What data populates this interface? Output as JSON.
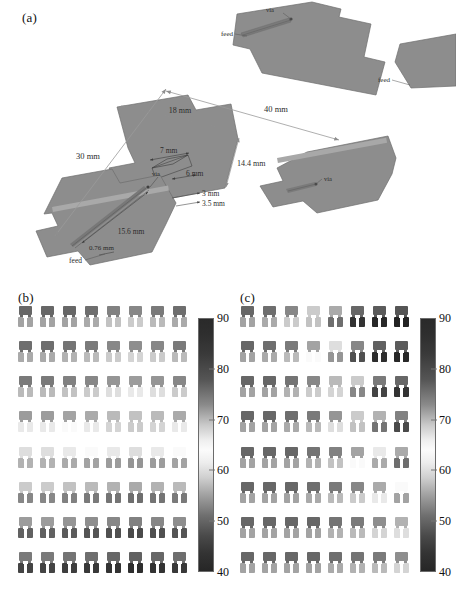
{
  "figure": {
    "panels": [
      {
        "id": "a",
        "label": "(a)"
      },
      {
        "id": "b",
        "label": "(b)"
      },
      {
        "id": "c",
        "label": "(c)"
      }
    ]
  },
  "panel_a": {
    "label": "(a)",
    "description": "Three-dimensional exploded schematic of a stacked patch antenna element with feed lines and vias",
    "annotations": [
      {
        "name": "overall-length",
        "text": "40 mm"
      },
      {
        "name": "overall-width",
        "text": "30 mm"
      },
      {
        "name": "patch-length",
        "text": "18 mm"
      },
      {
        "name": "patch-width",
        "text": "14.4 mm"
      },
      {
        "name": "slot-length",
        "text": "7 mm"
      },
      {
        "name": "slot-offset",
        "text": "6 mm"
      },
      {
        "name": "feedline-width-1",
        "text": "3 mm"
      },
      {
        "name": "feedline-width-2",
        "text": "3.5 mm"
      },
      {
        "name": "feed-length",
        "text": "15.6 mm"
      },
      {
        "name": "substrate-thickness",
        "text": "0.76 mm"
      },
      {
        "name": "via-top",
        "text": "via"
      },
      {
        "name": "via-middle",
        "text": "via"
      },
      {
        "name": "via-bottom",
        "text": "via"
      },
      {
        "name": "feed-top",
        "text": "feed"
      },
      {
        "name": "feed-bottom-left",
        "text": "feed"
      },
      {
        "name": "feed-right",
        "text": "feed"
      }
    ],
    "colors": {
      "metal_fill": "#8d8d8d",
      "metal_edge": "#6f6f6f",
      "dim_line": "#9a9a9a",
      "text": "#2b2b2b"
    }
  },
  "panel_b": {
    "label": "(b)",
    "rows": 8,
    "cols": 8,
    "caption": "",
    "chart_data": {
      "type": "heatmap",
      "title": "(b)",
      "xlabel": "",
      "ylabel": "",
      "rows": 8,
      "cols": 8,
      "cmap": "gray-inverted",
      "zlim": [
        40,
        90
      ],
      "values": [
        [
          88,
          88,
          88,
          87,
          84,
          83,
          85,
          87
        ],
        [
          87,
          87,
          86,
          85,
          83,
          82,
          83,
          85
        ],
        [
          85,
          85,
          84,
          83,
          81,
          80,
          81,
          83
        ],
        [
          80,
          80,
          79,
          78,
          76,
          75,
          76,
          78
        ],
        [
          72,
          72,
          71,
          70,
          69,
          68,
          69,
          70
        ],
        [
          66,
          66,
          65,
          64,
          63,
          62,
          63,
          64
        ],
        [
          60,
          60,
          59,
          58,
          57,
          56,
          57,
          58
        ],
        [
          55,
          55,
          54,
          53,
          52,
          51,
          52,
          53
        ]
      ]
    }
  },
  "panel_c": {
    "label": "(c)",
    "rows": 8,
    "cols": 8,
    "caption": "",
    "chart_data": {
      "type": "heatmap",
      "title": "(c)",
      "xlabel": "",
      "ylabel": "",
      "rows": 8,
      "cols": 8,
      "cmap": "gray-inverted",
      "zlim": [
        40,
        90
      ],
      "values": [
        [
          88,
          87,
          83,
          74,
          62,
          52,
          50,
          49
        ],
        [
          88,
          87,
          85,
          79,
          68,
          57,
          51,
          50
        ],
        [
          88,
          88,
          86,
          83,
          76,
          66,
          55,
          52
        ],
        [
          88,
          88,
          87,
          85,
          81,
          74,
          63,
          56
        ],
        [
          88,
          88,
          88,
          86,
          84,
          79,
          71,
          62
        ],
        [
          88,
          88,
          88,
          87,
          85,
          83,
          78,
          70
        ],
        [
          88,
          88,
          88,
          88,
          86,
          85,
          82,
          77
        ],
        [
          88,
          88,
          88,
          88,
          87,
          86,
          85,
          82
        ]
      ]
    }
  },
  "colorbar_b": {
    "name": "colorbar-b",
    "vmin": 40,
    "vmax": 90,
    "ticks": [
      "90",
      "80",
      "70",
      "60",
      "50",
      "40"
    ],
    "tick_values": [
      90,
      80,
      70,
      60,
      50,
      40
    ]
  },
  "colorbar_c": {
    "name": "colorbar-c",
    "vmin": 40,
    "vmax": 90,
    "ticks": [
      "90",
      "80",
      "70",
      "60",
      "50",
      "40"
    ],
    "tick_values": [
      90,
      80,
      70,
      60,
      50,
      40
    ]
  }
}
